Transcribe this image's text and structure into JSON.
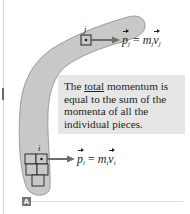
{
  "figure": {
    "panel_label": "A",
    "callout": {
      "prefix": "The ",
      "emphasis": "total",
      "suffix": " momentum is equal to the sum of the momenta of all the individual pieces."
    },
    "piece_j": {
      "label": "j",
      "equation": {
        "lhs_symbol": "p",
        "lhs_sub": "j",
        "equals": "=",
        "mass_symbol": "m",
        "mass_sub": "j",
        "vel_symbol": "v",
        "vel_sub": "j"
      }
    },
    "piece_i": {
      "label": "i",
      "equation": {
        "lhs_symbol": "p",
        "lhs_sub": "i",
        "equals": "=",
        "mass_symbol": "m",
        "mass_sub": "i",
        "vel_symbol": "v",
        "vel_sub": "i"
      }
    },
    "colors": {
      "boomerang_fill": "#c8c8c8",
      "boomerang_stroke": "#8a8a8a",
      "arrow": "#6d6e71",
      "callout_bg": "#e6e6e6",
      "text": "#231f20",
      "badge": "#777777"
    }
  }
}
